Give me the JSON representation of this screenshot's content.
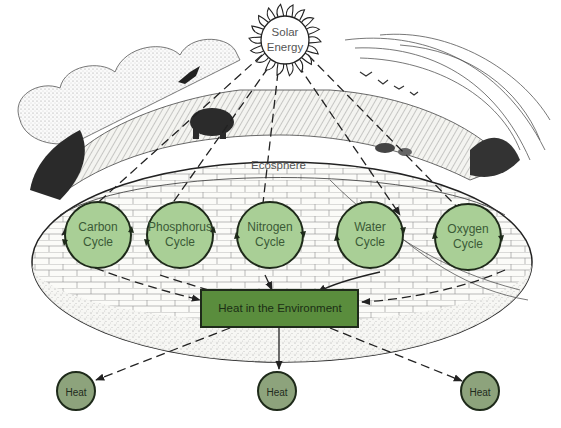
{
  "diagram": {
    "sun": {
      "label_line1": "Solar",
      "label_line2": "Energy",
      "fill": "#ffffff",
      "stroke": "#222222"
    },
    "ecosphere": {
      "label": "Ecosphere"
    },
    "cycles": [
      {
        "line1": "Carbon",
        "line2": "Cycle"
      },
      {
        "line1": "Phosphorus",
        "line2": "Cycle"
      },
      {
        "line1": "Nitrogen",
        "line2": "Cycle"
      },
      {
        "line1": "Water",
        "line2": "Cycle"
      },
      {
        "line1": "Oxygen",
        "line2": "Cycle"
      }
    ],
    "environment": {
      "label": "Heat in the Environment"
    },
    "heat_outputs": [
      {
        "label": "Heat"
      },
      {
        "label": "Heat"
      },
      {
        "label": "Heat"
      }
    ],
    "colors": {
      "cycle_fill": "#a9cf96",
      "cycle_stroke": "#1e2a1a",
      "environment_fill": "#5a8d3d",
      "environment_stroke": "#1e2a1a",
      "heat_fill": "#8da37c",
      "arrow": "#222222",
      "label_text": "#3b5a36"
    }
  }
}
